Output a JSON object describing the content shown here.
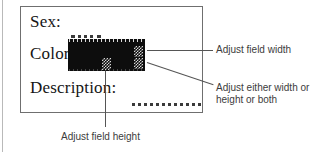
{
  "figure": {
    "colors": {
      "page_background": "#ffffff",
      "panel_border": "#6f6f6f",
      "label_text": "#151515",
      "annotation_text": "#3c3c3c",
      "selection_fill": "#0d0d0d",
      "handle_checker": "#d8d8d8",
      "leader_line": "#555555",
      "dotted_field": "#3a3a3a"
    }
  },
  "form": {
    "rows": [
      {
        "label": "Sex:",
        "field_type": "dotted-blank",
        "selected": false
      },
      {
        "label": "Color:",
        "field_type": "selected-box",
        "selected": true
      },
      {
        "label": "Description:",
        "field_type": "dotted-blank",
        "selected": false
      }
    ]
  },
  "handles": [
    {
      "name": "right-middle",
      "icon": "resize-handle-icon",
      "action": "Adjust field width"
    },
    {
      "name": "right-bottom",
      "icon": "resize-handle-icon",
      "action": "Adjust either width or height or both"
    },
    {
      "name": "bottom-center",
      "icon": "resize-handle-icon",
      "action": "Adjust field height"
    }
  ],
  "annotations": {
    "width": "Adjust field width",
    "both": "Adjust either width or\nheight or both",
    "height": "Adjust field height"
  }
}
